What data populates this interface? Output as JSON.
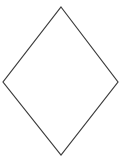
{
  "figure": {
    "title": "",
    "background_color": "#ffffff",
    "width": 128,
    "height": 161,
    "shape": {
      "name": "rhombus",
      "kind": "polygon-outline",
      "sides": 4,
      "filled": false,
      "fill_color": "none",
      "stroke_color": "#3c3c3c",
      "stroke_width": 1.2,
      "points_attr": "61,7 118,82 61,155 3,82",
      "vertices": [
        {
          "label": "top",
          "x": 61,
          "y": 7
        },
        {
          "label": "right",
          "x": 118,
          "y": 82
        },
        {
          "label": "bottom",
          "x": 61,
          "y": 155
        },
        {
          "label": "left",
          "x": 3,
          "y": 82
        }
      ],
      "diagonals": {
        "horizontal_length": 115,
        "vertical_length": 148
      }
    }
  }
}
